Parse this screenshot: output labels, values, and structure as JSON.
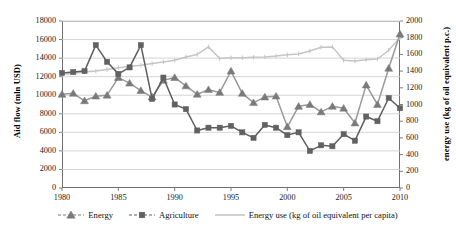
{
  "chart_data": {
    "type": "line",
    "title": "",
    "xlabel": "",
    "ylabel": "Aid flow (mln USD)",
    "y2label": "energy use (kg of oil equivalent p.c.)",
    "grid": true,
    "legend_position": "bottom",
    "xlim": [
      1980,
      2010
    ],
    "ylim": [
      0,
      18000
    ],
    "y2lim": [
      0,
      2000
    ],
    "xticks": [
      1980,
      1985,
      1990,
      1995,
      2000,
      2005,
      2010
    ],
    "xtick_labels": [
      "1980",
      "1985",
      "1990",
      "1995",
      "2000",
      "2005",
      "2010"
    ],
    "yticks": [
      0,
      2000,
      4000,
      6000,
      8000,
      10000,
      12000,
      14000,
      16000,
      18000
    ],
    "ytick_labels": [
      "0",
      "2000",
      "4000",
      "6000",
      "8000",
      "10000",
      "12000",
      "14000",
      "16000",
      "18000"
    ],
    "y2ticks": [
      0,
      200,
      400,
      600,
      800,
      1000,
      1200,
      1400,
      1600,
      1800,
      2000
    ],
    "y2tick_labels": [
      "0",
      "200",
      "400",
      "600",
      "800",
      "1000",
      "1200",
      "1400",
      "1600",
      "1800",
      "2000"
    ],
    "x": [
      1980,
      1981,
      1982,
      1983,
      1984,
      1985,
      1986,
      1987,
      1988,
      1989,
      1990,
      1991,
      1992,
      1993,
      1994,
      1995,
      1996,
      1997,
      1998,
      1999,
      2000,
      2001,
      2002,
      2003,
      2004,
      2005,
      2006,
      2007,
      2008,
      2009,
      2010
    ],
    "series": [
      {
        "name": "Energy",
        "axis": "left",
        "marker": "triangle",
        "color": "#7a7a7a",
        "line_color": "#9a9a9a",
        "values": [
          10100,
          10200,
          9400,
          9900,
          10000,
          11900,
          11300,
          10500,
          9800,
          11600,
          11900,
          11000,
          10100,
          10600,
          10300,
          12600,
          10200,
          9200,
          9800,
          9900,
          6600,
          8800,
          9000,
          8200,
          8800,
          8600,
          7000,
          11100,
          9000,
          12900,
          16600
        ]
      },
      {
        "name": "Agriculture",
        "axis": "left",
        "marker": "square",
        "color": "#616161",
        "line_color": "#5e5e5e",
        "values": [
          12400,
          12500,
          12600,
          15400,
          13600,
          12300,
          13000,
          15400,
          9600,
          11900,
          9000,
          8500,
          6200,
          6500,
          6500,
          6700,
          6000,
          5400,
          6800,
          6500,
          5700,
          6000,
          4000,
          4600,
          4500,
          5800,
          5100,
          7700,
          7200,
          9700,
          8600
        ]
      },
      {
        "name": "Energy use (kg of oil equivalent per capita)",
        "axis": "right",
        "marker": "none",
        "color": "#c5c5c5",
        "line_color": "#c5c5c5",
        "values": [
          1360,
          1375,
          1390,
          1400,
          1420,
          1440,
          1455,
          1470,
          1490,
          1510,
          1530,
          1570,
          1600,
          1690,
          1550,
          1560,
          1560,
          1565,
          1570,
          1580,
          1595,
          1605,
          1640,
          1685,
          1690,
          1530,
          1520,
          1535,
          1545,
          1650,
          1800
        ]
      }
    ]
  },
  "legend": {
    "items": [
      {
        "label": "Energy",
        "marker": "triangle",
        "color": "#7a7a7a"
      },
      {
        "label": "Agriculture",
        "marker": "square",
        "color": "#616161"
      },
      {
        "label": "Energy use (kg of oil equivalent per capita)",
        "marker": "none",
        "color": "#c5c5c5"
      }
    ]
  },
  "colors": {
    "energy": "#7a7a7a",
    "agriculture": "#616161",
    "energy_use": "#c5c5c5",
    "grid": "#c9c9c9",
    "axis": "#6f6f6f"
  }
}
